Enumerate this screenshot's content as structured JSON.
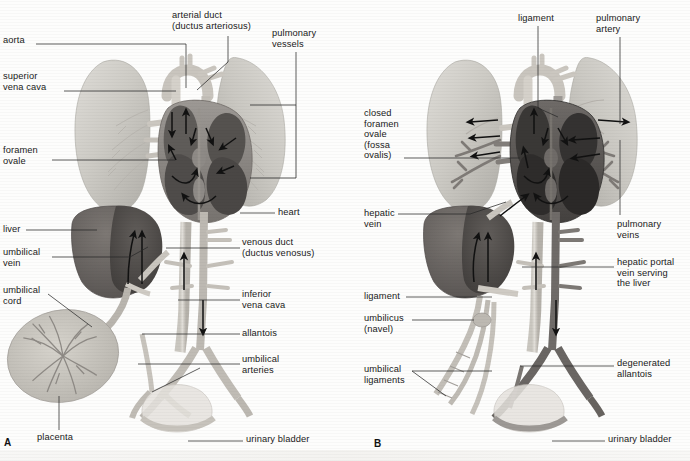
{
  "figure": {
    "type": "anatomical-illustration",
    "panels": [
      {
        "letter": "A",
        "name": "fetal-circulation",
        "labels_left": [
          {
            "text": "aorta",
            "x": 3,
            "y": 40,
            "leader": [
              [
                36,
                44
              ],
              [
                186,
                44
              ],
              [
                186,
                88
              ]
            ]
          },
          {
            "text": "superior\nvena cava",
            "x": 3,
            "y": 76,
            "leader": [
              [
                64,
                91
              ],
              [
                176,
                91
              ]
            ]
          },
          {
            "text": "foramen\novale",
            "x": 3,
            "y": 150,
            "leader": [
              [
                52,
                160
              ],
              [
                175,
                160
              ]
            ]
          },
          {
            "text": "liver",
            "x": 3,
            "y": 226,
            "leader": [
              [
                26,
                230
              ],
              [
                97,
                230
              ]
            ]
          },
          {
            "text": "umbilical\nvein",
            "x": 3,
            "y": 252,
            "leader": [
              [
                52,
                257
              ],
              [
                130,
                257
              ],
              [
                148,
                246
              ]
            ]
          },
          {
            "text": "umbilical\ncord",
            "x": 3,
            "y": 290,
            "leader": [
              [
                48,
                294
              ],
              [
                92,
                327
              ]
            ]
          }
        ],
        "labels_top": [
          {
            "text": "arterial duct\n(ductus arteriosus)",
            "x": 172,
            "y": 12,
            "leader": [
              [
                228,
                36
              ],
              [
                228,
                62
              ],
              [
                196,
                90
              ]
            ]
          },
          {
            "text": "pulmonary\nvessels",
            "x": 272,
            "y": 30,
            "leader": [
              [
                296,
                54
              ],
              [
                296,
                105
              ]
            ],
            "bracket": [
              [
                248,
                105
              ],
              [
                296,
                105
              ],
              [
                296,
                178
              ],
              [
                248,
                178
              ]
            ]
          }
        ],
        "labels_right": [
          {
            "text": "heart",
            "x": 278,
            "y": 209,
            "leader": [
              [
                240,
                213
              ],
              [
                275,
                213
              ]
            ]
          },
          {
            "text": "venous duct\n(ductus venosus)",
            "x": 242,
            "y": 242,
            "leader": [
              [
                166,
                248
              ],
              [
                240,
                248
              ]
            ]
          },
          {
            "text": "inferior\nvena cava",
            "x": 242,
            "y": 294,
            "leader": [
              [
                178,
                300
              ],
              [
                240,
                300
              ]
            ]
          },
          {
            "text": "allantois",
            "x": 242,
            "y": 330,
            "leader": [
              [
                142,
                334
              ],
              [
                240,
                334
              ]
            ]
          },
          {
            "text": "umbilical\narteries",
            "x": 242,
            "y": 359,
            "leader": [
              [
                138,
                364
              ],
              [
                240,
                364
              ]
            ]
          }
        ],
        "labels_bottom": [
          {
            "text": "placenta",
            "x": 37,
            "y": 434,
            "leader": [
              [
                59,
                395
              ],
              [
                59,
                431
              ]
            ]
          },
          {
            "text": "urinary bladder",
            "x": 246,
            "y": 437,
            "leader": [
              [
                188,
                441
              ],
              [
                243,
                441
              ]
            ]
          }
        ]
      },
      {
        "letter": "B",
        "name": "circulation-after-birth",
        "labels_left": [
          {
            "text": "closed\nforamen\novale\n(fossa\novalis)",
            "x": 364,
            "y": 110,
            "leader": [
              [
                404,
                158
              ],
              [
                520,
                158
              ]
            ]
          },
          {
            "text": "hepatic\nvein",
            "x": 364,
            "y": 210,
            "leader": [
              [
                398,
                214
              ],
              [
                470,
                214
              ],
              [
                512,
                202
              ]
            ]
          },
          {
            "text": "ligament",
            "x": 364,
            "y": 293,
            "leader": [
              [
                406,
                297
              ],
              [
                492,
                297
              ]
            ]
          },
          {
            "text": "umbilicus\n(navel)",
            "x": 364,
            "y": 316,
            "leader": [
              [
                412,
                320
              ],
              [
                478,
                320
              ]
            ]
          },
          {
            "text": "umbilical\nligaments",
            "x": 364,
            "y": 367,
            "leader": [
              [
                412,
                371
              ],
              [
                492,
                371
              ]
            ]
          }
        ],
        "labels_top": [
          {
            "text": "ligament",
            "x": 518,
            "y": 15,
            "leader": [
              [
                538,
                26
              ],
              [
                538,
                108
              ],
              [
                560,
                117
              ]
            ]
          },
          {
            "text": "pulmonary\nartery",
            "x": 596,
            "y": 15,
            "leader": [
              [
                620,
                37
              ],
              [
                620,
                122
              ]
            ]
          }
        ],
        "labels_right": [
          {
            "text": "pulmonary\nveins",
            "x": 617,
            "y": 222,
            "leader": [
              [
                620,
                66
              ],
              [
                620,
                215
              ]
            ]
          },
          {
            "text": "hepatic portal\nvein serving\nthe liver",
            "x": 617,
            "y": 262,
            "leader": [
              [
                530,
                267
              ],
              [
                614,
                267
              ]
            ]
          },
          {
            "text": "degenerated\nallantois",
            "x": 617,
            "y": 362,
            "leader": [
              [
                522,
                366
              ],
              [
                614,
                366
              ]
            ]
          }
        ],
        "labels_bottom": [
          {
            "text": "urinary bladder",
            "x": 608,
            "y": 437,
            "leader": [
              [
                552,
                441
              ],
              [
                605,
                441
              ]
            ]
          }
        ]
      }
    ]
  },
  "colors": {
    "background": "#fdfdfc",
    "lung": "#cfcdc8",
    "lung_shade": "#b6b4ae",
    "heart_light": "#b2adaa",
    "heart_dark": "#5d5a58",
    "heart_dark_b": "#4a4745",
    "liver": "#6b6663",
    "liver_light": "#8d8884",
    "vessel_pale": "#d8d5cf",
    "vessel_mid": "#bdb9b2",
    "vessel_dark": "#7a7672",
    "placenta": "#c9c6bf",
    "placenta_vessel": "#8b8782",
    "leader": "#2a2a2a",
    "text": "#1a1a1a"
  },
  "legend": {
    "panel_a_letter": "A",
    "panel_b_letter": "B"
  }
}
